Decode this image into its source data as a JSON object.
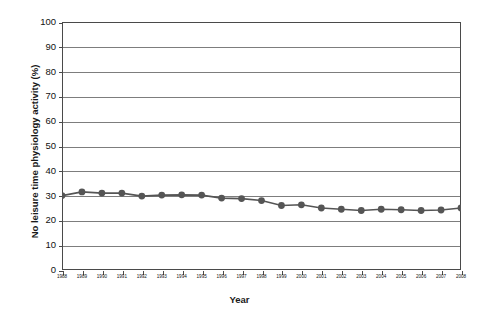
{
  "chart_data": {
    "type": "line",
    "title": "",
    "xlabel": "Year",
    "ylabel": "No leisure time physiology activity (%)",
    "xlim": [
      1988,
      2008
    ],
    "ylim": [
      0,
      100
    ],
    "grid": true,
    "legend": "none",
    "series_color": "#555555",
    "marker": "circle",
    "categories": [
      "1988",
      "1989",
      "1990",
      "1991",
      "1992",
      "1993",
      "1994",
      "1995",
      "1996",
      "1997",
      "1998",
      "1999",
      "2000",
      "2001",
      "2002",
      "2003",
      "2004",
      "2005",
      "2006",
      "2007",
      "2008"
    ],
    "values": [
      30.0,
      31.5,
      31.0,
      31.0,
      29.8,
      30.2,
      30.3,
      30.2,
      29.0,
      28.8,
      28.0,
      26.0,
      26.3,
      25.0,
      24.5,
      24.0,
      24.5,
      24.3,
      24.0,
      24.2,
      25.0
    ],
    "yticks": [
      0,
      10,
      20,
      30,
      40,
      50,
      60,
      70,
      80,
      90,
      100
    ],
    "xticks": [
      "1988",
      "1989",
      "1990",
      "1991",
      "1992",
      "1993",
      "1994",
      "1995",
      "1996",
      "1997",
      "1998",
      "1999",
      "2000",
      "2001",
      "2002",
      "2003",
      "2004",
      "2005",
      "2006",
      "2007",
      "2008"
    ]
  }
}
